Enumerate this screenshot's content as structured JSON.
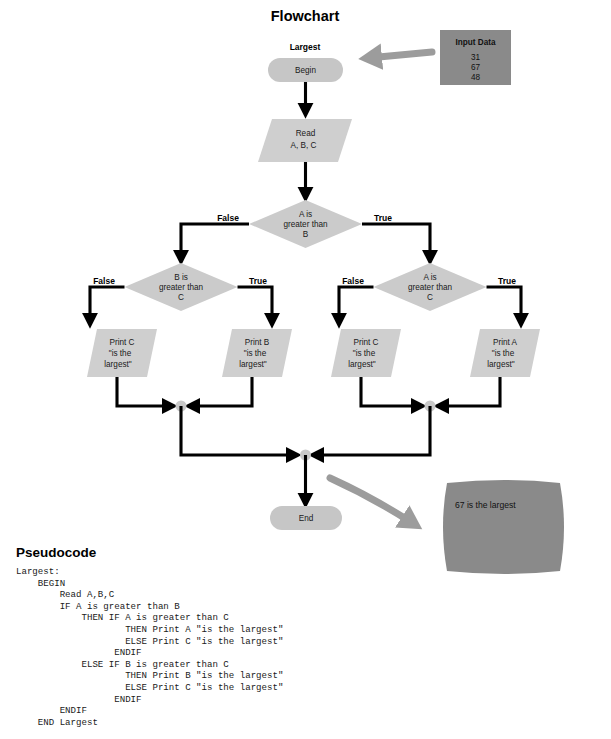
{
  "title": "Flowchart",
  "program_label": "Largest",
  "pseudocode_heading": "Pseudocode",
  "colors": {
    "shape_fill": "#cfcfcf",
    "diamond_fill": "#cbcbcb",
    "pill_fill": "#c6c6c6",
    "input_box_fill": "#8a8a8a",
    "screen_fill": "#8a8a8a",
    "arrow_line": "#000000",
    "fat_arrow": "#9c9c9c",
    "junction_dot": "#c9c9c9"
  },
  "input_data": {
    "header": "Input Data",
    "values": [
      "31",
      "67",
      "48"
    ]
  },
  "output_screen": {
    "text": "67 is the largest"
  },
  "nodes": {
    "begin": "Begin",
    "read": {
      "line1": "Read",
      "line2": "A, B, C"
    },
    "decision_ab": {
      "line1": "A is",
      "line2": "greater than",
      "line3": "B"
    },
    "decision_bc": {
      "line1": "B is",
      "line2": "greater than",
      "line3": "C"
    },
    "decision_ac": {
      "line1": "A is",
      "line2": "greater than",
      "line3": "C"
    },
    "print_c_left": {
      "line1": "Print C",
      "line2": "\"is the",
      "line3": "largest\""
    },
    "print_b": {
      "line1": "Print B",
      "line2": "\"is the",
      "line3": "largest\""
    },
    "print_c_right": {
      "line1": "Print C",
      "line2": "\"is the",
      "line3": "largest\""
    },
    "print_a": {
      "line1": "Print A",
      "line2": "\"is the",
      "line3": "largest\""
    },
    "end": "End"
  },
  "branch_labels": {
    "ab_false": "False",
    "ab_true": "True",
    "bc_false": "False",
    "bc_true": "True",
    "ac_false": "False",
    "ac_true": "True"
  },
  "pseudocode": "Largest:\n    BEGIN\n        Read A,B,C\n        IF A is greater than B\n            THEN IF A is greater than C\n                    THEN Print A \"is the largest\"\n                    ELSE Print C \"is the largest\"\n                  ENDIF\n            ELSE IF B is greater than C\n                    THEN Print B \"is the largest\"\n                    ELSE Print C \"is the largest\"\n                  ENDIF\n        ENDIF\n    END Largest"
}
